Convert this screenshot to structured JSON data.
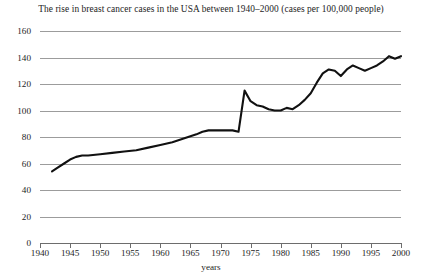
{
  "chart_data": {
    "type": "line",
    "title": "The rise in breast cancer cases in the USA between 1940–2000 (cases per 100,000 people)",
    "xlabel": "years",
    "ylabel": "",
    "xlim": [
      1940,
      2000
    ],
    "ylim": [
      0,
      160
    ],
    "grid": true,
    "legend": false,
    "y_ticks": [
      0,
      20,
      40,
      60,
      80,
      100,
      120,
      140,
      160
    ],
    "x_ticks": [
      1940,
      1945,
      1950,
      1955,
      1960,
      1965,
      1970,
      1975,
      1980,
      1985,
      1990,
      1995,
      2000
    ],
    "series": [
      {
        "name": "breast cancer cases per 100,000 people",
        "color": "#111111",
        "x": [
          1942,
          1943,
          1944,
          1945,
          1946,
          1947,
          1948,
          1950,
          1952,
          1954,
          1956,
          1958,
          1960,
          1962,
          1964,
          1966,
          1967,
          1968,
          1969,
          1970,
          1971,
          1972,
          1973,
          1974,
          1975,
          1976,
          1977,
          1978,
          1979,
          1980,
          1981,
          1982,
          1983,
          1984,
          1985,
          1986,
          1987,
          1988,
          1989,
          1990,
          1991,
          1992,
          1993,
          1994,
          1995,
          1996,
          1997,
          1998,
          1999,
          2000
        ],
        "y": [
          54,
          57,
          60,
          63,
          65,
          66,
          66,
          67,
          68,
          69,
          70,
          72,
          74,
          76,
          79,
          82,
          84,
          85,
          85,
          85,
          85,
          85,
          84,
          115,
          107,
          104,
          103,
          101,
          100,
          100,
          102,
          101,
          104,
          108,
          113,
          121,
          128,
          131,
          130,
          126,
          131,
          134,
          132,
          130,
          132,
          134,
          137,
          141,
          139,
          141
        ]
      }
    ]
  },
  "axes": {
    "y_labels": [
      "160",
      "140",
      "120",
      "100",
      "80",
      "60",
      "40",
      "20",
      "0"
    ],
    "x_labels": [
      "1940",
      "1945",
      "1950",
      "1955",
      "1960",
      "1965",
      "1970",
      "1975",
      "1980",
      "1985",
      "1990",
      "1995",
      "2000"
    ],
    "x_axis_title": "years"
  },
  "style": {
    "line_color": "#111111",
    "grid_color": "#9c9c9c",
    "axis_color": "#6d6d6d",
    "text_color": "#1d1d1d",
    "background": "#ffffff"
  }
}
